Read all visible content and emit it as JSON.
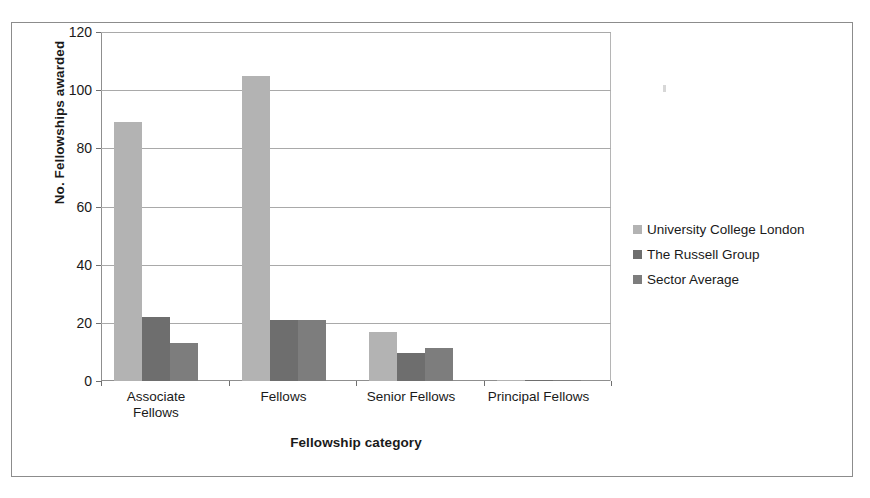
{
  "chart_data": {
    "type": "bar",
    "title": "",
    "xlabel": "Fellowship category",
    "ylabel": "No. Fellowships awarded",
    "categories": [
      "Associate\nFellows",
      "Fellows",
      "Senior Fellows",
      "Principal Fellows"
    ],
    "series": [
      {
        "name": "University College London",
        "color": "#b3b3b3",
        "values": [
          89,
          105,
          17,
          0.5
        ]
      },
      {
        "name": "The Russell Group",
        "color": "#6e6e6e",
        "values": [
          22,
          21,
          9.5,
          0.5
        ]
      },
      {
        "name": "Sector Average",
        "color": "#7d7d7d",
        "values": [
          13,
          21,
          11.5,
          0.5
        ]
      }
    ],
    "ylim": [
      0,
      120
    ],
    "yticks": [
      0,
      20,
      40,
      60,
      80,
      100,
      120
    ],
    "ytick_labels": [
      "0",
      "20",
      "40",
      "60",
      "80",
      "100",
      "120"
    ],
    "grid": true,
    "legend_position": "right",
    "axis_color": "#8f8f8f",
    "gridline_color": "#a9a9a9",
    "frame_color": "#8c8c8c"
  }
}
